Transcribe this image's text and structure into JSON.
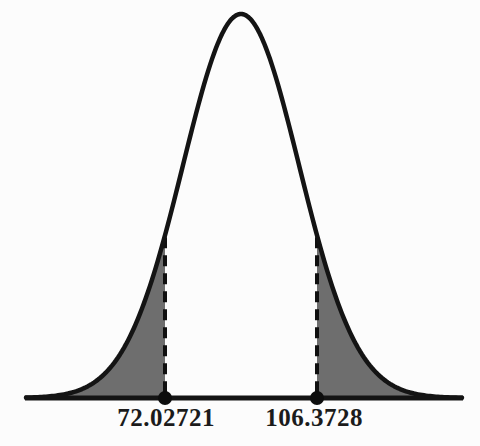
{
  "chart_data": {
    "type": "area",
    "subtype": "normal-distribution-curve-two-shaded-tails",
    "title": "",
    "xlabel": "",
    "ylabel": "",
    "cutoffs": [
      72.02721,
      106.3728
    ],
    "cutoff_labels": [
      "72.02721",
      "106.3728"
    ],
    "shaded_regions": [
      "left tail below 72.02721",
      "right tail above 106.3728"
    ],
    "markers": [
      "dashed vertical line and axis dot at each cutoff"
    ],
    "grid": "off",
    "legend": "none",
    "colors": {
      "curve": "#141414",
      "axis": "#141414",
      "shade": "#6e6e6e",
      "dashed_line": "#101010",
      "dot": "#0d0d0d",
      "background": "#fcfcfc",
      "text": "#1b1b1b"
    },
    "layout": {
      "width": 480,
      "height": 446,
      "axis_y": 398,
      "axis_x_start": 25,
      "axis_x_end": 463,
      "axis_stroke": 5,
      "peak_x": 241,
      "peak_y": 14,
      "sigma_px": 58,
      "cutoff_x": [
        165,
        317
      ],
      "label_center_x": [
        166,
        314
      ],
      "label_top_y": 404,
      "dot_radius": 7,
      "curve_stroke": 4.5,
      "dash_stroke": 4,
      "dash_pattern": "11 7"
    }
  },
  "labels": {
    "left_cutoff": "72.02721",
    "right_cutoff": "106.3728"
  }
}
